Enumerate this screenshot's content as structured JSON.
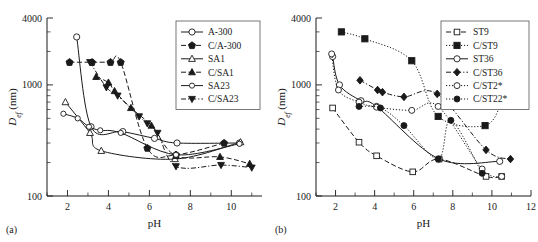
{
  "figure": {
    "panel_a_label": "(a)",
    "panel_b_label": "(b)"
  },
  "chart_data": [
    {
      "type": "scatter",
      "panel": "(a)",
      "title": "",
      "xlabel": "pH",
      "ylabel": "D_ef (nm)",
      "ylabel_base": "D",
      "ylabel_sub": "ef",
      "ylabel_unit": " (nm)",
      "yscale": "log",
      "ylim": [
        100,
        4000
      ],
      "ytick_labels": [
        "100",
        "1000",
        "4000"
      ],
      "ytick_values": [
        100,
        1000,
        4000
      ],
      "xlim": [
        1,
        11.5
      ],
      "xtick_labels": [
        "2",
        "4",
        "6",
        "8",
        "10"
      ],
      "xtick_values": [
        2,
        4,
        6,
        8,
        10
      ],
      "grid": false,
      "legend_position": "top-right",
      "series": [
        {
          "name": "A-300",
          "marker": "circle-open",
          "line": "solid",
          "points": [
            [
              2.45,
              2700
            ],
            [
              3.15,
              420
            ],
            [
              4.7,
              380
            ],
            [
              6.25,
              330
            ],
            [
              7.35,
              300
            ],
            [
              10.4,
              300
            ]
          ]
        },
        {
          "name": "C/A-300",
          "marker": "pentagon-filled",
          "line": "dashed",
          "points": [
            [
              2.1,
              1600
            ],
            [
              3.2,
              1600
            ],
            [
              4.1,
              1600
            ],
            [
              4.6,
              1600
            ],
            [
              5.9,
              270
            ],
            [
              7.3,
              235
            ],
            [
              9.65,
              300
            ]
          ]
        },
        {
          "name": "SA1",
          "marker": "triangle-up-open",
          "line": "solid",
          "points": [
            [
              1.9,
              700
            ],
            [
              3.1,
              370
            ],
            [
              3.65,
              255
            ],
            [
              7.25,
              215
            ],
            [
              10.45,
              305
            ]
          ]
        },
        {
          "name": "C/SA1",
          "marker": "triangle-up-filled",
          "line": "dashed",
          "points": [
            [
              3.4,
              1180
            ],
            [
              4.0,
              1050
            ],
            [
              4.3,
              880
            ],
            [
              5.1,
              620
            ],
            [
              6.1,
              430
            ],
            [
              7.3,
              230
            ],
            [
              9.45,
              225
            ],
            [
              10.9,
              195
            ]
          ]
        },
        {
          "name": "SA23",
          "marker": "circle-open-small",
          "line": "solid",
          "points": [
            [
              1.8,
              550
            ],
            [
              2.5,
              500
            ],
            [
              3.05,
              420
            ],
            [
              3.6,
              390
            ],
            [
              4.6,
              370
            ],
            [
              7.3,
              235
            ],
            [
              10.4,
              295
            ]
          ]
        },
        {
          "name": "C/SA23",
          "marker": "triangle-down-filled",
          "line": "dash-dot",
          "points": [
            [
              3.1,
              1600
            ],
            [
              3.9,
              950
            ],
            [
              4.45,
              800
            ],
            [
              5.5,
              520
            ],
            [
              5.9,
              450
            ],
            [
              6.4,
              370
            ],
            [
              7.3,
              185
            ],
            [
              9.5,
              190
            ],
            [
              11.0,
              180
            ]
          ]
        }
      ]
    },
    {
      "type": "scatter",
      "panel": "(b)",
      "title": "",
      "xlabel": "pH",
      "ylabel": "D_ef (nm)",
      "ylabel_base": "D",
      "ylabel_sub": "ef",
      "ylabel_unit": " (nm)",
      "yscale": "log",
      "ylim": [
        100,
        4000
      ],
      "ytick_labels": [
        "100",
        "1000",
        "4000"
      ],
      "ytick_values": [
        100,
        1000,
        4000
      ],
      "xlim": [
        1,
        12
      ],
      "xtick_labels": [
        "2",
        "4",
        "6",
        "8",
        "10",
        "12"
      ],
      "xtick_values": [
        2,
        4,
        6,
        8,
        10,
        12
      ],
      "grid": false,
      "legend_position": "top-right",
      "series": [
        {
          "name": "ST9",
          "marker": "square-open",
          "line": "dashed",
          "points": [
            [
              1.85,
              620
            ],
            [
              3.2,
              305
            ],
            [
              4.1,
              230
            ],
            [
              5.95,
              165
            ],
            [
              7.3,
              215
            ],
            [
              9.7,
              150
            ],
            [
              10.5,
              150
            ]
          ]
        },
        {
          "name": "C/ST9",
          "marker": "square-filled",
          "line": "dotted",
          "points": [
            [
              2.3,
              3000
            ],
            [
              3.5,
              2600
            ],
            [
              5.9,
              1650
            ],
            [
              7.25,
              520
            ],
            [
              9.65,
              430
            ],
            [
              10.5,
              700
            ]
          ]
        },
        {
          "name": "ST36",
          "marker": "circle-open",
          "line": "solid",
          "points": [
            [
              1.85,
              1800
            ],
            [
              2.2,
              1000
            ],
            [
              3.3,
              720
            ],
            [
              4.1,
              640
            ],
            [
              7.3,
              215
            ],
            [
              10.4,
              205
            ]
          ]
        },
        {
          "name": "C/ST36",
          "marker": "diamond-filled",
          "line": "dash-dot",
          "points": [
            [
              3.25,
              1100
            ],
            [
              4.15,
              900
            ],
            [
              4.4,
              860
            ],
            [
              5.5,
              780
            ],
            [
              7.2,
              830
            ],
            [
              9.7,
              260
            ],
            [
              10.95,
              215
            ]
          ]
        },
        {
          "name": "C/ST2*",
          "marker": "circle-open-gray",
          "line": "dotted",
          "points": [
            [
              1.8,
              1900
            ],
            [
              2.15,
              900
            ],
            [
              3.2,
              700
            ],
            [
              4.1,
              630
            ],
            [
              5.9,
              590
            ],
            [
              7.25,
              640
            ],
            [
              9.5,
              175
            ],
            [
              10.5,
              150
            ]
          ]
        },
        {
          "name": "C/ST22*",
          "marker": "circle-filled",
          "line": "dotted",
          "points": [
            [
              3.2,
              640
            ],
            [
              4.3,
              620
            ],
            [
              5.5,
              430
            ],
            [
              7.25,
              215
            ],
            [
              7.9,
              480
            ],
            [
              9.5,
              160
            ]
          ]
        }
      ]
    }
  ]
}
